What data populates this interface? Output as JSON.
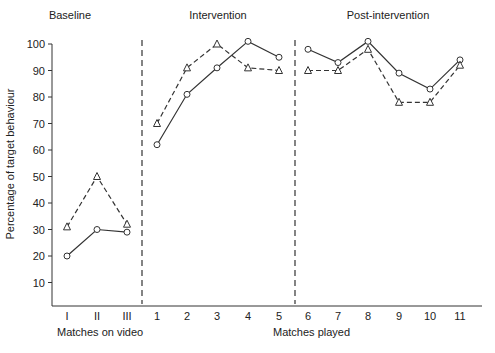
{
  "chart_data": {
    "type": "line",
    "title": "",
    "xlabel_groups": [
      {
        "label": "Matches on video",
        "categories": [
          "I",
          "II",
          "III"
        ]
      },
      {
        "label": "Matches played",
        "categories": [
          "1",
          "2",
          "3",
          "4",
          "5",
          "6",
          "7",
          "8",
          "9",
          "10",
          "11"
        ]
      }
    ],
    "categories": [
      "I",
      "II",
      "III",
      "1",
      "2",
      "3",
      "4",
      "5",
      "6",
      "7",
      "8",
      "9",
      "10",
      "11"
    ],
    "ylabel": "Percentage of target behaviour",
    "ylim": [
      0,
      100
    ],
    "yticks": [
      10,
      20,
      30,
      40,
      50,
      60,
      70,
      80,
      90,
      100
    ],
    "grid": false,
    "legend": null,
    "phases": [
      {
        "label": "Baseline",
        "categories": [
          "I",
          "II",
          "III"
        ]
      },
      {
        "label": "Intervention",
        "categories": [
          "1",
          "2",
          "3",
          "4",
          "5"
        ]
      },
      {
        "label": "Post-intervention",
        "categories": [
          "6",
          "7",
          "8",
          "9",
          "10",
          "11"
        ]
      }
    ],
    "phase_dividers": [
      "between III and 1",
      "between 5 and 6"
    ],
    "series": [
      {
        "name": "circle-solid",
        "marker": "circle",
        "line": "solid",
        "values": [
          20,
          30,
          29,
          62,
          81,
          91,
          101,
          95,
          98,
          93,
          101,
          89,
          83,
          94
        ]
      },
      {
        "name": "triangle-dashed",
        "marker": "triangle",
        "line": "dashed",
        "values": [
          31,
          50,
          32,
          70,
          91,
          100,
          91,
          90,
          90,
          90,
          98,
          78,
          78,
          92
        ]
      }
    ]
  },
  "labels": {
    "phase_baseline": "Baseline",
    "phase_intervention": "Intervention",
    "phase_post": "Post-intervention",
    "y_axis": "Percentage of target behaviour",
    "x_group_video": "Matches on video",
    "x_group_played": "Matches played"
  }
}
